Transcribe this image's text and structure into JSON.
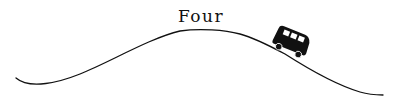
{
  "diagram": {
    "label": "Four",
    "elements": [
      {
        "type": "curve",
        "description": "hill outline"
      },
      {
        "type": "icon",
        "name": "van-icon",
        "position": "descending right slope"
      }
    ],
    "colors": {
      "ink": "#111111",
      "background": "#ffffff"
    }
  }
}
